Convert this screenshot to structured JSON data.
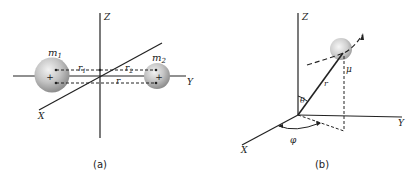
{
  "figure": {
    "panel_a": {
      "caption": "(a)",
      "axes": {
        "x": "X",
        "y": "Y",
        "z": "Z"
      },
      "masses": [
        {
          "label": "m",
          "sub": "1"
        },
        {
          "label": "m",
          "sub": "2"
        }
      ],
      "distances": [
        {
          "label": "r",
          "sub": "1"
        },
        {
          "label": "r",
          "sub": "2"
        },
        {
          "label": "r",
          "sub": ""
        }
      ],
      "center_marks": [
        "+",
        "+"
      ]
    },
    "panel_b": {
      "caption": "(b)",
      "axes": {
        "x": "X",
        "y": "Y",
        "z": "Z"
      },
      "reduced_mass": "μ",
      "radius": "r",
      "polar_angle": "θ",
      "azimuth_angle": "φ"
    }
  }
}
